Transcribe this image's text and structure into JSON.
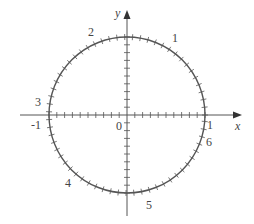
{
  "diagram": {
    "axes": {
      "x_label": "x",
      "y_label": "y",
      "origin_label": "0",
      "x_neg_label": "-1",
      "x_pos_label": "1"
    },
    "radian_labels": [
      {
        "value": 1,
        "text": "1"
      },
      {
        "value": 2,
        "text": "2"
      },
      {
        "value": 3,
        "text": "3"
      },
      {
        "value": 4,
        "text": "4"
      },
      {
        "value": 5,
        "text": "5"
      },
      {
        "value": 6,
        "text": "6"
      }
    ],
    "tick_spacing_axis": 0.1,
    "tick_spacing_arc": 0.1,
    "colors": {
      "stroke": "#555555",
      "text": "#444444",
      "background": "#ffffff"
    }
  }
}
